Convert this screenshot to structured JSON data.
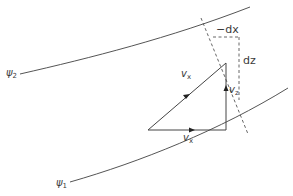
{
  "diagram": {
    "colors": {
      "stroke": "#4a4a4a",
      "text": "#3a3a3a",
      "background": "#ffffff"
    },
    "streamlines": [
      {
        "id": "psi2",
        "label_symbol": "ψ",
        "label_sub": "2"
      },
      {
        "id": "psi1",
        "label_symbol": "ψ",
        "label_sub": "1"
      }
    ],
    "vectors": {
      "hypotenuse": {
        "symbol": "v",
        "sub": "x"
      },
      "horizontal": {
        "symbol": "v",
        "sub": "x"
      },
      "vertical": {
        "symbol": "v",
        "sub": "z"
      }
    },
    "increments": {
      "dx_label": "−dx",
      "dz_label": "dz"
    }
  }
}
